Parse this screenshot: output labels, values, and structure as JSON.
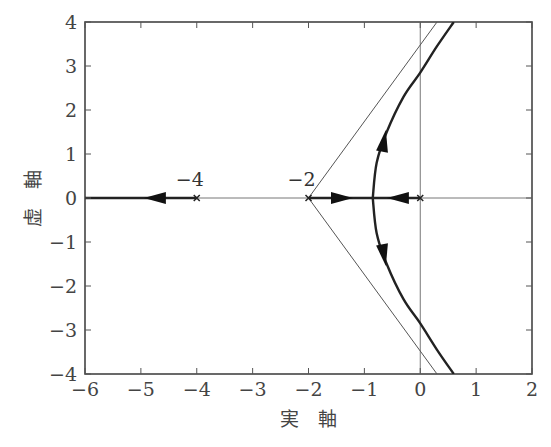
{
  "chart_data": {
    "type": "line",
    "title": "",
    "xlabel": "実　軸",
    "ylabel": "虚　軸",
    "xlim": [
      -6,
      2
    ],
    "ylim": [
      -4,
      4
    ],
    "grid": false,
    "xticks": [
      -6,
      -5,
      -4,
      -3,
      -2,
      -1,
      0,
      1,
      2
    ],
    "yticks": [
      -4,
      -3,
      -2,
      -1,
      0,
      1,
      2,
      3,
      4
    ],
    "xtick_labels": [
      "−6",
      "−5",
      "−4",
      "−3",
      "−2",
      "−1",
      "0",
      "1",
      "2"
    ],
    "ytick_labels": [
      "−4",
      "−3",
      "−2",
      "−1",
      "0",
      "1",
      "2",
      "3",
      "4"
    ],
    "poles": [
      {
        "x": 0,
        "y": 0,
        "label": ""
      },
      {
        "x": -2,
        "y": 0,
        "label": "−2"
      },
      {
        "x": -4,
        "y": 0,
        "label": "−4"
      }
    ],
    "asymptote_center": {
      "x": -2,
      "y": 0
    },
    "asymptotes": [
      {
        "from": [
          -2,
          0
        ],
        "to": [
          0.3,
          4
        ]
      },
      {
        "from": [
          -2,
          0
        ],
        "to": [
          0.3,
          -4
        ]
      }
    ],
    "breakaway_point": {
      "x": -0.85,
      "y": 0
    },
    "series": [
      {
        "name": "branch-left",
        "points": [
          [
            -4,
            0
          ],
          [
            -6,
            0
          ]
        ],
        "arrow_at": [
          -4.75,
          0
        ],
        "direction": "left"
      },
      {
        "name": "branch-from-minus2",
        "points": [
          [
            -2,
            0
          ],
          [
            -0.85,
            0
          ]
        ],
        "arrow_at": [
          -1.4,
          0
        ],
        "direction": "right"
      },
      {
        "name": "branch-from-0",
        "points": [
          [
            0,
            0
          ],
          [
            -0.85,
            0
          ]
        ],
        "arrow_at": [
          -0.4,
          0
        ],
        "direction": "left"
      },
      {
        "name": "branch-upper",
        "points": [
          [
            -0.85,
            0
          ],
          [
            -0.78,
            0.8
          ],
          [
            -0.6,
            1.5
          ],
          [
            -0.3,
            2.3
          ],
          [
            0,
            2.85
          ],
          [
            0.3,
            3.45
          ],
          [
            0.6,
            4
          ]
        ],
        "arrow_at": [
          -0.65,
          1.3
        ],
        "direction": "up"
      },
      {
        "name": "branch-lower",
        "points": [
          [
            -0.85,
            0
          ],
          [
            -0.78,
            -0.8
          ],
          [
            -0.6,
            -1.5
          ],
          [
            -0.3,
            -2.3
          ],
          [
            0,
            -2.85
          ],
          [
            0.3,
            -3.45
          ],
          [
            0.6,
            -4
          ]
        ],
        "arrow_at": [
          -0.65,
          -1.3
        ],
        "direction": "down"
      }
    ]
  }
}
